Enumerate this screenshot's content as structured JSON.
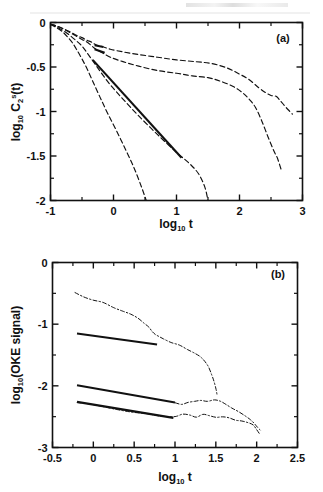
{
  "figure": {
    "background": "#ffffff",
    "ink": "#111111",
    "artifact_note": "scan artifact strip at top of page"
  },
  "panels": [
    {
      "id": "a",
      "label": "(a)",
      "xlabel_main": "log",
      "xlabel_sub": "10",
      "xlabel_tail": " t",
      "ylabel_main": "log",
      "ylabel_sub": "10",
      "ylabel_tail": " C",
      "ylabel_sub2": "2",
      "ylabel_sup2": "s",
      "ylabel_tail2": "(t)",
      "xticks": [
        "-1",
        "0",
        "1",
        "2",
        "3"
      ],
      "yticks": [
        "0",
        "-0.5",
        "-1",
        "-1.5",
        "-2"
      ]
    },
    {
      "id": "b",
      "label": "(b)",
      "xlabel_main": "log",
      "xlabel_sub": "10",
      "xlabel_tail": " t",
      "ylabel_main": "log",
      "ylabel_sub": "10",
      "ylabel_tail": "(OKE signal)",
      "xticks": [
        "-0.5",
        "0",
        "0.5",
        "1",
        "1.5",
        "2",
        "2.5"
      ],
      "yticks": [
        "0",
        "-1",
        "-2",
        "-3"
      ]
    }
  ],
  "chart_data": [
    {
      "type": "line",
      "panel": "a",
      "title": "",
      "xlabel": "log10 t",
      "ylabel": "log10 C2^s(t)",
      "xlim": [
        -1,
        3
      ],
      "ylim": [
        -2,
        0
      ],
      "xticks": [
        -1,
        0,
        1,
        2,
        3
      ],
      "yticks": [
        -2,
        -1.5,
        -1,
        -0.5,
        0
      ],
      "grid": false,
      "legend": null,
      "annotations": [
        {
          "text": "(a)",
          "x": 2.72,
          "y": -0.09
        }
      ],
      "series": [
        {
          "name": "curve-1-slowest",
          "style": "dashed",
          "points": [
            [
              -1.0,
              -0.02
            ],
            [
              -0.9,
              -0.04
            ],
            [
              -0.8,
              -0.07
            ],
            [
              -0.7,
              -0.1
            ],
            [
              -0.6,
              -0.14
            ],
            [
              -0.5,
              -0.17
            ],
            [
              -0.42,
              -0.2
            ],
            [
              -0.35,
              -0.22
            ],
            [
              -0.28,
              -0.25
            ],
            [
              -0.18,
              -0.27
            ],
            [
              -0.05,
              -0.3
            ],
            [
              0.15,
              -0.33
            ],
            [
              0.4,
              -0.36
            ],
            [
              0.7,
              -0.39
            ],
            [
              1.0,
              -0.42
            ],
            [
              1.3,
              -0.44
            ],
            [
              1.55,
              -0.46
            ],
            [
              1.8,
              -0.51
            ],
            [
              2.0,
              -0.58
            ],
            [
              2.15,
              -0.64
            ],
            [
              2.3,
              -0.73
            ],
            [
              2.42,
              -0.79
            ],
            [
              2.5,
              -0.82
            ],
            [
              2.58,
              -0.83
            ],
            [
              2.65,
              -0.88
            ],
            [
              2.72,
              -0.94
            ],
            [
              2.8,
              -1.0
            ],
            [
              2.84,
              -1.03
            ]
          ],
          "fit_overlay": {
            "style": "solid",
            "x_range": [
              -0.3,
              -0.16
            ],
            "y_range": [
              -0.255,
              -0.275
            ]
          }
        },
        {
          "name": "curve-2",
          "style": "dashed",
          "points": [
            [
              -1.0,
              -0.02
            ],
            [
              -0.9,
              -0.04
            ],
            [
              -0.8,
              -0.07
            ],
            [
              -0.7,
              -0.11
            ],
            [
              -0.6,
              -0.15
            ],
            [
              -0.5,
              -0.19
            ],
            [
              -0.42,
              -0.22
            ],
            [
              -0.35,
              -0.26
            ],
            [
              -0.28,
              -0.3
            ],
            [
              -0.18,
              -0.34
            ],
            [
              -0.05,
              -0.39
            ],
            [
              0.15,
              -0.44
            ],
            [
              0.4,
              -0.49
            ],
            [
              0.7,
              -0.54
            ],
            [
              1.0,
              -0.57
            ],
            [
              1.25,
              -0.6
            ],
            [
              1.5,
              -0.62
            ],
            [
              1.7,
              -0.66
            ],
            [
              1.9,
              -0.72
            ],
            [
              2.05,
              -0.79
            ],
            [
              2.15,
              -0.86
            ],
            [
              2.25,
              -0.95
            ],
            [
              2.35,
              -1.1
            ],
            [
              2.45,
              -1.28
            ],
            [
              2.55,
              -1.45
            ],
            [
              2.6,
              -1.52
            ],
            [
              2.66,
              -1.65
            ]
          ],
          "fit_overlay": {
            "style": "solid",
            "x_range": [
              -0.3,
              -0.14
            ],
            "y_range": [
              -0.3,
              -0.34
            ]
          }
        },
        {
          "name": "curve-3",
          "style": "dashed",
          "points": [
            [
              -1.0,
              -0.02
            ],
            [
              -0.9,
              -0.05
            ],
            [
              -0.8,
              -0.09
            ],
            [
              -0.7,
              -0.14
            ],
            [
              -0.6,
              -0.2
            ],
            [
              -0.52,
              -0.25
            ],
            [
              -0.45,
              -0.31
            ],
            [
              -0.38,
              -0.38
            ],
            [
              -0.3,
              -0.46
            ],
            [
              -0.2,
              -0.56
            ],
            [
              -0.05,
              -0.7
            ],
            [
              0.15,
              -0.86
            ],
            [
              0.4,
              -1.05
            ],
            [
              0.7,
              -1.26
            ],
            [
              1.0,
              -1.46
            ],
            [
              1.2,
              -1.58
            ],
            [
              1.35,
              -1.7
            ],
            [
              1.45,
              -1.85
            ],
            [
              1.5,
              -2.0
            ]
          ],
          "fit_overlay": {
            "style": "solid",
            "x_range": [
              -0.33,
              1.08
            ],
            "y_range": [
              -0.42,
              -1.52
            ]
          }
        },
        {
          "name": "curve-4-fastest",
          "style": "dashed",
          "points": [
            [
              -1.0,
              -0.02
            ],
            [
              -0.9,
              -0.06
            ],
            [
              -0.8,
              -0.11
            ],
            [
              -0.72,
              -0.17
            ],
            [
              -0.65,
              -0.23
            ],
            [
              -0.58,
              -0.31
            ],
            [
              -0.5,
              -0.41
            ],
            [
              -0.42,
              -0.52
            ],
            [
              -0.33,
              -0.66
            ],
            [
              -0.22,
              -0.83
            ],
            [
              -0.1,
              -1.01
            ],
            [
              0.05,
              -1.22
            ],
            [
              0.2,
              -1.44
            ],
            [
              0.33,
              -1.64
            ],
            [
              0.44,
              -1.84
            ],
            [
              0.52,
              -2.0
            ]
          ],
          "fit_overlay": null
        }
      ]
    },
    {
      "type": "line",
      "panel": "b",
      "title": "",
      "xlabel": "log10 t",
      "ylabel": "log10(OKE signal)",
      "xlim": [
        -0.5,
        2.5
      ],
      "ylim": [
        -3,
        0
      ],
      "xticks": [
        -0.5,
        0,
        0.5,
        1,
        1.5,
        2,
        2.5
      ],
      "yticks": [
        -3,
        -2,
        -1,
        0
      ],
      "grid": false,
      "legend": null,
      "annotations": [
        {
          "text": "(b)",
          "x": 2.28,
          "y": -0.12
        }
      ],
      "series": [
        {
          "name": "oke-data-upper",
          "style": "dash-dot-noisy",
          "points": [
            [
              -0.22,
              -0.5
            ],
            [
              -0.12,
              -0.55
            ],
            [
              0.0,
              -0.6
            ],
            [
              0.12,
              -0.66
            ],
            [
              0.25,
              -0.72
            ],
            [
              0.36,
              -0.78
            ],
            [
              0.46,
              -0.84
            ],
            [
              0.55,
              -0.91
            ],
            [
              0.62,
              -0.98
            ],
            [
              0.68,
              -1.05
            ],
            [
              0.72,
              -1.11
            ],
            [
              0.76,
              -1.16
            ],
            [
              0.8,
              -1.2
            ],
            [
              0.86,
              -1.24
            ],
            [
              0.95,
              -1.29
            ],
            [
              1.05,
              -1.34
            ],
            [
              1.15,
              -1.4
            ],
            [
              1.25,
              -1.47
            ],
            [
              1.33,
              -1.56
            ],
            [
              1.4,
              -1.68
            ],
            [
              1.45,
              -1.82
            ],
            [
              1.48,
              -1.95
            ],
            [
              1.5,
              -2.06
            ],
            [
              1.51,
              -2.14
            ]
          ],
          "fit_overlay": {
            "style": "solid",
            "x_range": [
              -0.2,
              0.78
            ],
            "y_range": [
              -1.15,
              -1.33
            ]
          }
        },
        {
          "name": "oke-data-lower",
          "style": "dash-dot-noisy",
          "points": [
            [
              -0.2,
              -2.26
            ],
            [
              -0.05,
              -2.3
            ],
            [
              0.12,
              -2.34
            ],
            [
              0.3,
              -2.38
            ],
            [
              0.48,
              -2.42
            ],
            [
              0.65,
              -2.46
            ],
            [
              0.82,
              -2.49
            ],
            [
              0.95,
              -2.51
            ],
            [
              1.02,
              -2.49
            ],
            [
              1.1,
              -2.46
            ],
            [
              1.18,
              -2.48
            ],
            [
              1.26,
              -2.5
            ],
            [
              1.34,
              -2.47
            ],
            [
              1.42,
              -2.49
            ],
            [
              1.5,
              -2.52
            ],
            [
              1.58,
              -2.5
            ],
            [
              1.66,
              -2.53
            ],
            [
              1.74,
              -2.56
            ],
            [
              1.82,
              -2.58
            ],
            [
              1.9,
              -2.6
            ],
            [
              1.96,
              -2.64
            ],
            [
              2.0,
              -2.7
            ],
            [
              2.03,
              -2.77
            ]
          ],
          "fit_overlay": {
            "style": "solid",
            "x_range": [
              -0.2,
              0.98
            ],
            "y_range": [
              -2.26,
              -2.52
            ]
          }
        },
        {
          "name": "oke-data-middle-branch",
          "style": "dash-dot-noisy",
          "points": [
            [
              1.0,
              -2.27
            ],
            [
              1.08,
              -2.3
            ],
            [
              1.16,
              -2.27
            ],
            [
              1.24,
              -2.24
            ],
            [
              1.32,
              -2.23
            ],
            [
              1.4,
              -2.25
            ],
            [
              1.48,
              -2.23
            ],
            [
              1.56,
              -2.26
            ],
            [
              1.62,
              -2.3
            ],
            [
              1.7,
              -2.36
            ],
            [
              1.78,
              -2.42
            ],
            [
              1.86,
              -2.48
            ],
            [
              1.92,
              -2.54
            ],
            [
              1.97,
              -2.6
            ],
            [
              2.01,
              -2.66
            ],
            [
              2.04,
              -2.72
            ]
          ],
          "fit_overlay": {
            "style": "solid",
            "x_range": [
              -0.2,
              1.0
            ],
            "y_range": [
              -1.99,
              -2.27
            ]
          }
        }
      ]
    }
  ]
}
